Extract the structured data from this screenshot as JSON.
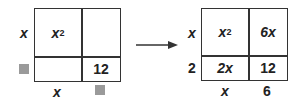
{
  "left_model": {
    "row_labels": [
      "x",
      "?"
    ],
    "col_labels": [
      "x",
      "?"
    ],
    "cells": {
      "top_left": "x",
      "top_left_exp": "2",
      "top_right": "",
      "bottom_left": "",
      "bottom_right": "12"
    }
  },
  "right_model": {
    "row_labels": [
      "x",
      "2"
    ],
    "col_labels": [
      "x",
      "6"
    ],
    "cells": {
      "top_left": "x",
      "top_left_exp": "2",
      "top_right": "6x",
      "bottom_left": "2x",
      "bottom_right": "12"
    }
  },
  "colors": {
    "line": "#333333",
    "placeholder": "#9a9a9a"
  }
}
